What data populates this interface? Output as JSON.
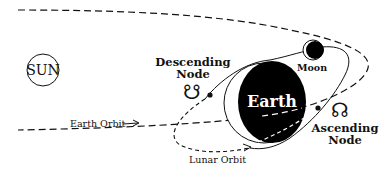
{
  "diagram": {
    "labels": {
      "sun": "SUN",
      "earth": "Earth",
      "moon": "Moon",
      "descending_node_line1": "Descending",
      "descending_node_line2": "Node",
      "ascending_node_line1": "Ascending",
      "ascending_node_line2": "Node",
      "earth_orbit": "Earth Orbit",
      "lunar_orbit": "Lunar Orbit"
    },
    "symbols": {
      "descending_node": "☋",
      "ascending_node": "☊"
    },
    "colors": {
      "ink": "#111111",
      "background": "#ffffff",
      "earth_fill": "#000000",
      "moon_fill": "#000000"
    },
    "elements": [
      {
        "name": "sun",
        "shape": "circle-outline"
      },
      {
        "name": "earth",
        "shape": "filled-disc-with-crescent"
      },
      {
        "name": "moon",
        "shape": "filled-disc-with-crescent"
      },
      {
        "name": "earth-orbit",
        "style": "dashed"
      },
      {
        "name": "lunar-orbit",
        "style": "solid-front / dashed-back"
      },
      {
        "name": "descending-node",
        "marker": "dot"
      },
      {
        "name": "ascending-node",
        "marker": "dot"
      }
    ]
  }
}
